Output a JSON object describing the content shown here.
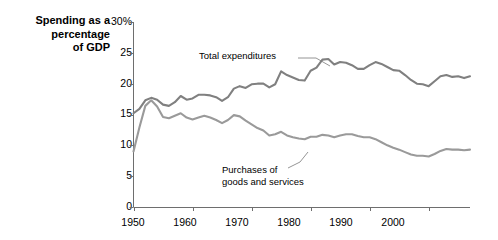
{
  "chart_data": {
    "type": "line",
    "title": "Spending as a\npercentage\nof GDP",
    "xlabel": "",
    "ylabel": "Spending as a percentage of GDP",
    "xlim": [
      1950,
      2007
    ],
    "ylim": [
      0,
      30
    ],
    "grid": false,
    "legend_position": "inline-annotations",
    "ytick_labels": [
      "30%",
      "25",
      "20",
      "15",
      "10",
      "5",
      "0"
    ],
    "ytick_values": [
      30,
      25,
      20,
      15,
      10,
      5,
      0
    ],
    "xtick_labels": [
      "1950",
      "1960",
      "1970",
      "1980",
      "1990",
      "2000"
    ],
    "xtick_values": [
      1950,
      1960,
      1970,
      1980,
      1990,
      2000
    ],
    "x": [
      1950,
      1951,
      1952,
      1953,
      1954,
      1955,
      1956,
      1957,
      1958,
      1959,
      1960,
      1961,
      1962,
      1963,
      1964,
      1965,
      1966,
      1967,
      1968,
      1969,
      1970,
      1971,
      1972,
      1973,
      1974,
      1975,
      1976,
      1977,
      1978,
      1979,
      1980,
      1981,
      1982,
      1983,
      1984,
      1985,
      1986,
      1987,
      1988,
      1989,
      1990,
      1991,
      1992,
      1993,
      1994,
      1995,
      1996,
      1997,
      1998,
      1999,
      2000,
      2001,
      2002,
      2003,
      2004,
      2005,
      2006,
      2007
    ],
    "series": [
      {
        "name": "Total expenditures",
        "color": "#808080",
        "label_text": "Total expenditures",
        "values": [
          15.2,
          15.9,
          17.3,
          17.7,
          17.4,
          16.6,
          16.4,
          17.0,
          18.0,
          17.4,
          17.6,
          18.2,
          18.2,
          18.1,
          17.8,
          17.2,
          17.8,
          19.2,
          19.6,
          19.3,
          19.9,
          20.0,
          20.0,
          19.4,
          19.9,
          22.0,
          21.4,
          21.0,
          20.6,
          20.5,
          22.1,
          22.6,
          23.9,
          24.0,
          23.1,
          23.5,
          23.4,
          23.0,
          22.4,
          22.4,
          23.0,
          23.5,
          23.2,
          22.7,
          22.2,
          22.1,
          21.4,
          20.6,
          20.0,
          19.9,
          19.6,
          20.4,
          21.2,
          21.4,
          21.1,
          21.2,
          20.9,
          21.2
        ]
      },
      {
        "name": "Purchases of goods and services",
        "color": "#9a9a9a",
        "label_text": "Purchases of\ngoods and services",
        "values": [
          9.0,
          12.9,
          16.4,
          17.3,
          16.3,
          14.6,
          14.4,
          14.8,
          15.2,
          14.5,
          14.2,
          14.5,
          14.8,
          14.5,
          14.1,
          13.6,
          14.1,
          14.9,
          14.7,
          14.0,
          13.4,
          12.8,
          12.4,
          11.6,
          11.8,
          12.2,
          11.6,
          11.3,
          11.1,
          11.0,
          11.4,
          11.4,
          11.7,
          11.6,
          11.3,
          11.6,
          11.8,
          11.8,
          11.5,
          11.3,
          11.3,
          11.0,
          10.5,
          10.0,
          9.6,
          9.3,
          8.9,
          8.5,
          8.3,
          8.3,
          8.2,
          8.6,
          9.1,
          9.4,
          9.3,
          9.3,
          9.2,
          9.3
        ]
      }
    ],
    "annotations": [
      {
        "text": "Total expenditures",
        "anchor_year": 1979,
        "anchor_value": 20.5
      },
      {
        "text": "Purchases of\ngoods and services",
        "anchor_year": 1980,
        "anchor_value": 11.4
      }
    ]
  }
}
